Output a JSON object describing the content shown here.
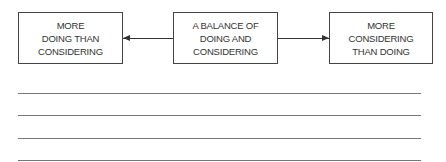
{
  "diagram": {
    "boxes": [
      {
        "id": "left",
        "text": "MORE\nDOING THAN\nCONSIDERING"
      },
      {
        "id": "middle",
        "text": "A BALANCE OF\nDOING AND\nCONSIDERING"
      },
      {
        "id": "right",
        "text": "MORE\nCONSIDERING\nTHAN DOING"
      }
    ],
    "arrows": [
      {
        "from": "middle",
        "to": "left"
      },
      {
        "from": "middle",
        "to": "right"
      }
    ],
    "writing_lines": 4,
    "colors": {
      "border": "#444444",
      "text": "#333333",
      "rule": "#777777"
    }
  }
}
